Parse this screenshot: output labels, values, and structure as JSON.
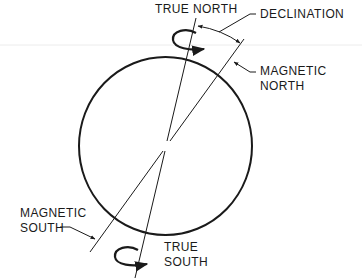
{
  "diagram": {
    "labels": {
      "true_north": "TRUE NORTH",
      "declination": "DECLINATION",
      "magnetic_north": [
        "MAGNETIC",
        "NORTH"
      ],
      "magnetic_south": [
        "MAGNETIC",
        "SOUTH"
      ],
      "true_south": [
        "TRUE",
        "SOUTH"
      ]
    },
    "elements": {
      "globe": "circle",
      "true_axis": "line from true north to true south",
      "magnetic_axis": "line from magnetic north to magnetic south",
      "declination_arc": "angle arc between true north and magnetic north",
      "rotation_arrows": [
        "top rotation arrow",
        "bottom rotation arrow"
      ]
    },
    "colors": {
      "ink": "#1a1a1a",
      "background": "#ffffff",
      "scan_line": "#e4e4e4"
    }
  }
}
